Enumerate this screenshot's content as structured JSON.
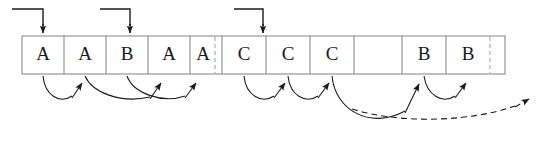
{
  "diagram": {
    "background_color": "#ffffff",
    "line_color": "#1a1a1a",
    "cell_border_color": "#808080",
    "dashed_border_color": "#9a9a9a"
  },
  "array": {
    "name": "cell-row",
    "x": 22,
    "y": 36,
    "height": 38,
    "cells": [
      {
        "index": 0,
        "label": "A",
        "x": 22,
        "width": 42
      },
      {
        "index": 1,
        "label": "A",
        "x": 64,
        "width": 42
      },
      {
        "index": 2,
        "label": "B",
        "x": 106,
        "width": 42
      },
      {
        "index": 3,
        "label": "A",
        "x": 148,
        "width": 42
      },
      {
        "index": 4,
        "label": "A",
        "x": 190,
        "width": 25
      },
      {
        "index": 5,
        "label": "C",
        "x": 222,
        "width": 44
      },
      {
        "index": 6,
        "label": "C",
        "x": 266,
        "width": 44
      },
      {
        "index": 7,
        "label": "C",
        "x": 310,
        "width": 44
      },
      {
        "index": 8,
        "label": "",
        "x": 354,
        "width": 48
      },
      {
        "index": 9,
        "label": "B",
        "x": 402,
        "width": 44
      },
      {
        "index": 10,
        "label": "B",
        "x": 446,
        "width": 44
      }
    ],
    "dashed_dividers": [
      215,
      490
    ],
    "right_edge": 505
  },
  "top_pointers": [
    {
      "name": "pointer-1",
      "start_x": 12,
      "down_x": 43,
      "top_y": 8,
      "tip_y": 34,
      "target_cell": 0
    },
    {
      "name": "pointer-2",
      "start_x": 100,
      "down_x": 130,
      "top_y": 8,
      "tip_y": 34,
      "target_cell": 2
    },
    {
      "name": "pointer-3",
      "start_x": 234,
      "down_x": 263,
      "top_y": 8,
      "tip_y": 34,
      "target_cell": 5
    }
  ],
  "link_arrows": [
    {
      "name": "link-a1-to-a2",
      "style": "solid",
      "from_cell": 0,
      "to_cell": 1
    },
    {
      "name": "link-a2-to-a4",
      "style": "solid",
      "from_cell": 1,
      "to_cell": 3
    },
    {
      "name": "link-b3-to-a5",
      "style": "solid",
      "from_cell": 2,
      "to_cell": 4
    },
    {
      "name": "link-c6-to-c7",
      "style": "solid",
      "from_cell": 5,
      "to_cell": 6
    },
    {
      "name": "link-c7-to-c8",
      "style": "solid",
      "from_cell": 6,
      "to_cell": 7
    },
    {
      "name": "link-c8-to-b10",
      "style": "solid",
      "from_cell": 7,
      "to_cell": 9
    },
    {
      "name": "link-b10-to-b11",
      "style": "solid",
      "from_cell": 9,
      "to_cell": 10
    },
    {
      "name": "link-b11-to-next",
      "style": "dashed",
      "from_cell": 10,
      "to_cell": null
    }
  ]
}
